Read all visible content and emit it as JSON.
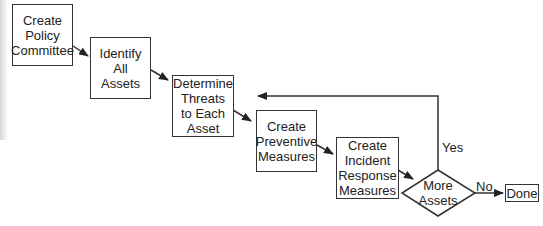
{
  "diagram": {
    "type": "flowchart",
    "nodes": [
      {
        "id": "n1",
        "shape": "rect",
        "label": "Create\nPolicy\nCommittee"
      },
      {
        "id": "n2",
        "shape": "rect",
        "label": "Identify\nAll\nAssets"
      },
      {
        "id": "n3",
        "shape": "rect",
        "label": "Determine\nThreats\nto Each\nAsset"
      },
      {
        "id": "n4",
        "shape": "rect",
        "label": "Create\nPreventive\nMeasures"
      },
      {
        "id": "n5",
        "shape": "rect",
        "label": "Create\nIncident\nResponse\nMeasures"
      },
      {
        "id": "n6",
        "shape": "diamond",
        "label": "More\nAssets"
      },
      {
        "id": "n7",
        "shape": "rect",
        "label": "Done"
      }
    ],
    "edges": [
      {
        "from": "n1",
        "to": "n2",
        "label": ""
      },
      {
        "from": "n2",
        "to": "n3",
        "label": ""
      },
      {
        "from": "n3",
        "to": "n4",
        "label": ""
      },
      {
        "from": "n4",
        "to": "n5",
        "label": ""
      },
      {
        "from": "n5",
        "to": "n6",
        "label": ""
      },
      {
        "from": "n6",
        "to": "n3",
        "label": "Yes"
      },
      {
        "from": "n6",
        "to": "n7",
        "label": "No"
      }
    ],
    "colors": {
      "stroke": "#333333",
      "text": "#222222",
      "background": "#ffffff"
    }
  }
}
